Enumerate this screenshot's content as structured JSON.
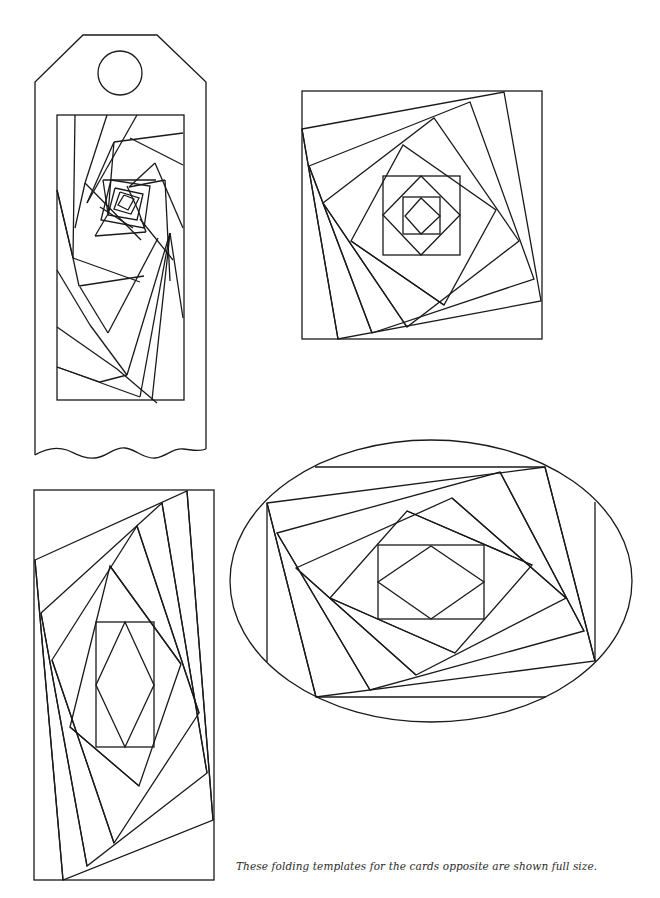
{
  "page": {
    "caption": "These folding templates for the cards opposite are shown full size.",
    "ink_color": "#1a1a1a",
    "background": "#ffffff"
  },
  "templates": [
    {
      "id": "tag",
      "label": "tag-template",
      "outline": "M35,455 L35,82 L83,35 L157,35 L206,82 L206,449",
      "wave": "M35,455 C45,449 55,446 67,450 C77,454 84,459 95,458 C107,457 113,447 125,448 C136,449 143,459 155,458 C166,457 172,448 183,449 C193,450 200,452 206,449",
      "hole": {
        "cx": 120,
        "cy": 73,
        "r": 22
      },
      "frame": {
        "x": 57,
        "y": 115,
        "w": 127,
        "h": 285
      },
      "lines": [
        [
          [
            75,
            115
          ],
          [
            73,
            258
          ]
        ],
        [
          [
            73,
            258
          ],
          [
            57,
            190
          ]
        ],
        [
          [
            107,
            115
          ],
          [
            85,
            183
          ]
        ],
        [
          [
            85,
            183
          ],
          [
            75,
            228
          ]
        ],
        [
          [
            137,
            115
          ],
          [
            87,
            203
          ]
        ],
        [
          [
            87,
            203
          ],
          [
            114,
            142
          ]
        ],
        [
          [
            114,
            142
          ],
          [
            183,
            133
          ]
        ],
        [
          [
            114,
            142
          ],
          [
            108,
            214
          ]
        ],
        [
          [
            130,
            138
          ],
          [
            183,
            165
          ]
        ],
        [
          [
            155,
            163
          ],
          [
            129,
            187
          ]
        ],
        [
          [
            155,
            163
          ],
          [
            183,
            228
          ]
        ],
        [
          [
            129,
            187
          ],
          [
            165,
            180
          ]
        ],
        [
          [
            165,
            180
          ],
          [
            170,
            281
          ]
        ],
        [
          [
            108,
            214
          ],
          [
            95,
            236
          ]
        ],
        [
          [
            95,
            236
          ],
          [
            146,
            232
          ]
        ],
        [
          [
            146,
            232
          ],
          [
            138,
            210
          ]
        ],
        [
          [
            138,
            210
          ],
          [
            127,
            186
          ]
        ],
        [
          [
            103,
            180
          ],
          [
            156,
            180
          ]
        ],
        [
          [
            103,
            180
          ],
          [
            108,
            214
          ]
        ],
        [
          [
            100,
            207
          ],
          [
            133,
            228
          ]
        ],
        [
          [
            140,
            219
          ],
          [
            173,
            260
          ]
        ],
        [
          [
            85,
            183
          ],
          [
            141,
            240
          ]
        ],
        [
          [
            57,
            190
          ],
          [
            73,
            258
          ]
        ],
        [
          [
            73,
            258
          ],
          [
            140,
            282
          ]
        ],
        [
          [
            73,
            258
          ],
          [
            79,
            286
          ]
        ],
        [
          [
            79,
            286
          ],
          [
            144,
            276
          ]
        ],
        [
          [
            80,
            287
          ],
          [
            108,
            333
          ]
        ],
        [
          [
            108,
            333
          ],
          [
            158,
            238
          ]
        ],
        [
          [
            57,
            270
          ],
          [
            90,
            325
          ]
        ],
        [
          [
            90,
            325
          ],
          [
            127,
            375
          ]
        ],
        [
          [
            127,
            375
          ],
          [
            170,
            233
          ]
        ],
        [
          [
            57,
            327
          ],
          [
            117,
            369
          ]
        ],
        [
          [
            117,
            369
          ],
          [
            157,
            403
          ]
        ],
        [
          [
            57,
            367
          ],
          [
            140,
            397
          ]
        ],
        [
          [
            140,
            397
          ],
          [
            170,
            233
          ]
        ],
        [
          [
            152,
            400
          ],
          [
            170,
            233
          ]
        ],
        [
          [
            170,
            233
          ],
          [
            183,
            318
          ]
        ],
        [
          [
            127,
            375
          ],
          [
            100,
            382
          ]
        ],
        [
          [
            100,
            382
          ],
          [
            57,
            367
          ]
        ]
      ],
      "spiral_center": [
        [
          [
            124,
            195
          ],
          [
            134,
            199
          ],
          [
            128,
            210
          ],
          [
            118,
            205
          ],
          [
            124,
            195
          ]
        ],
        [
          [
            120,
            192
          ],
          [
            139,
            198
          ],
          [
            131,
            214
          ],
          [
            114,
            209
          ],
          [
            120,
            192
          ]
        ],
        [
          [
            115,
            188
          ],
          [
            143,
            194
          ],
          [
            137,
            220
          ],
          [
            108,
            215
          ],
          [
            115,
            188
          ]
        ],
        [
          [
            111,
            180
          ],
          [
            150,
            186
          ],
          [
            144,
            228
          ],
          [
            101,
            220
          ],
          [
            111,
            180
          ]
        ]
      ]
    },
    {
      "id": "square",
      "label": "square-template",
      "frame": {
        "x": 302,
        "y": 91,
        "w": 240,
        "h": 248
      },
      "quads": [
        [
          [
            302,
            129
          ],
          [
            504,
            92
          ],
          [
            541,
            301
          ],
          [
            338,
            339
          ]
        ],
        [
          [
            309,
            166
          ],
          [
            470,
            102
          ],
          [
            534,
            279
          ],
          [
            372,
            333
          ]
        ],
        [
          [
            323,
            203
          ],
          [
            434,
            118
          ],
          [
            519,
            241
          ],
          [
            407,
            327
          ]
        ],
        [
          [
            351,
            241
          ],
          [
            403,
            145
          ],
          [
            496,
            210
          ],
          [
            444,
            305
          ]
        ]
      ],
      "lines": [
        [
          [
            302,
            129
          ],
          [
            338,
            339
          ]
        ],
        [
          [
            309,
            166
          ],
          [
            372,
            333
          ]
        ],
        [
          [
            323,
            203
          ],
          [
            407,
            327
          ]
        ],
        [
          [
            351,
            241
          ],
          [
            444,
            305
          ]
        ]
      ],
      "inner_squares": [
        {
          "x": 383,
          "y": 176,
          "w": 77,
          "h": 79
        },
        {
          "x": 403,
          "y": 197,
          "w": 37,
          "h": 37
        }
      ],
      "diamonds": [
        [
          [
            421,
            176
          ],
          [
            460,
            215
          ],
          [
            421,
            255
          ],
          [
            383,
            215
          ]
        ],
        [
          [
            421,
            198
          ],
          [
            440,
            216
          ],
          [
            421,
            234
          ],
          [
            405,
            216
          ]
        ]
      ]
    },
    {
      "id": "rectangle",
      "label": "rectangle-template",
      "frame": {
        "x": 34,
        "y": 490,
        "w": 180,
        "h": 390
      },
      "quads": [
        [
          [
            35,
            560
          ],
          [
            187,
            491
          ],
          [
            213,
            820
          ],
          [
            63,
            880
          ]
        ],
        [
          [
            41,
            613
          ],
          [
            162,
            503
          ],
          [
            207,
            773
          ],
          [
            87,
            866
          ]
        ],
        [
          [
            52,
            660
          ],
          [
            137,
            526
          ],
          [
            199,
            713
          ],
          [
            114,
            843
          ]
        ],
        [
          [
            70,
            727
          ],
          [
            110,
            566
          ],
          [
            181,
            664
          ],
          [
            139,
            786
          ]
        ]
      ],
      "lines": [
        [
          [
            35,
            560
          ],
          [
            63,
            880
          ]
        ],
        [
          [
            41,
            613
          ],
          [
            87,
            866
          ]
        ],
        [
          [
            52,
            660
          ],
          [
            114,
            843
          ]
        ],
        [
          [
            70,
            727
          ],
          [
            139,
            786
          ]
        ],
        [
          [
            187,
            491
          ],
          [
            213,
            820
          ]
        ],
        [
          [
            162,
            503
          ],
          [
            207,
            773
          ]
        ],
        [
          [
            137,
            526
          ],
          [
            199,
            713
          ]
        ],
        [
          [
            110,
            566
          ],
          [
            181,
            664
          ]
        ]
      ],
      "inner_rect": {
        "x": 96,
        "y": 622,
        "w": 58,
        "h": 125
      },
      "diamond": [
        [
          125,
          622
        ],
        [
          154,
          685
        ],
        [
          125,
          747
        ],
        [
          96,
          685
        ]
      ]
    },
    {
      "id": "oval",
      "label": "oval-template",
      "ellipse": {
        "cx": 431,
        "cy": 581,
        "rx": 201,
        "ry": 141
      },
      "quads": [
        [
          [
            267,
            503
          ],
          [
            545,
            467
          ],
          [
            595,
            661
          ],
          [
            316,
            697
          ]
        ],
        [
          [
            277,
            533
          ],
          [
            500,
            472
          ],
          [
            584,
            631
          ],
          [
            370,
            690
          ]
        ],
        [
          [
            296,
            568
          ],
          [
            452,
            498
          ],
          [
            566,
            598
          ],
          [
            416,
            675
          ]
        ],
        [
          [
            330,
            598
          ],
          [
            407,
            511
          ],
          [
            532,
            565
          ],
          [
            455,
            653
          ]
        ]
      ],
      "lines": [
        [
          [
            315,
            467
          ],
          [
            545,
            467
          ]
        ],
        [
          [
            316,
            697
          ],
          [
            546,
            697
          ]
        ],
        [
          [
            267,
            503
          ],
          [
            267,
            662
          ]
        ],
        [
          [
            595,
            502
          ],
          [
            595,
            661
          ]
        ],
        [
          [
            267,
            503
          ],
          [
            316,
            697
          ]
        ],
        [
          [
            277,
            533
          ],
          [
            370,
            690
          ]
        ],
        [
          [
            296,
            568
          ],
          [
            416,
            675
          ]
        ],
        [
          [
            330,
            598
          ],
          [
            455,
            653
          ]
        ],
        [
          [
            545,
            467
          ],
          [
            595,
            661
          ]
        ],
        [
          [
            500,
            472
          ],
          [
            584,
            631
          ]
        ],
        [
          [
            452,
            498
          ],
          [
            566,
            598
          ]
        ],
        [
          [
            407,
            511
          ],
          [
            532,
            565
          ]
        ]
      ],
      "inner_rect": {
        "x": 378,
        "y": 545,
        "w": 106,
        "h": 74
      },
      "diamond": [
        [
          431,
          546
        ],
        [
          484,
          582
        ],
        [
          431,
          619
        ],
        [
          378,
          582
        ]
      ]
    }
  ]
}
